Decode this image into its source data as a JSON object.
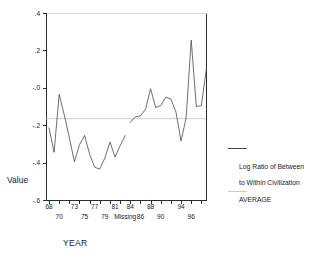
{
  "chart_data": {
    "type": "line",
    "title": "",
    "xlabel": "YEAR",
    "ylabel": "Value",
    "ylim": [
      -0.6,
      0.4
    ],
    "yticks": [
      0.4,
      0.2,
      -0.0,
      -0.2,
      -0.4,
      -0.6
    ],
    "ytick_labels": [
      ".4",
      ".2",
      "-.0",
      "-.2",
      "-.4",
      "-.6"
    ],
    "xtick_labels_row_a": [
      "68",
      "73",
      "77",
      "81",
      "84",
      "88",
      "94"
    ],
    "xtick_labels_row_b": [
      "70",
      "75",
      "79",
      "Missing",
      "86",
      "90",
      "96"
    ],
    "x_categories": [
      "68",
      "69",
      "70",
      "71",
      "72",
      "73",
      "74",
      "75",
      "76",
      "77",
      "78",
      "79",
      "80",
      "81",
      "82",
      "Missing",
      "83",
      "84",
      "85",
      "86",
      "87",
      "88",
      "89",
      "90",
      "91",
      "92",
      "93",
      "94",
      "95",
      "96",
      "97"
    ],
    "grid": false,
    "legend_position": "right",
    "series": [
      {
        "name": "Log Ratio of Between to Within Civilization",
        "color": "#4a4a4a",
        "style": "solid",
        "segments": [
          {
            "x": [
              "68",
              "69",
              "70",
              "71",
              "72",
              "73",
              "74",
              "75",
              "76",
              "77",
              "78",
              "79",
              "80",
              "81",
              "82"
            ],
            "values": [
              -0.215,
              -0.345,
              -0.035,
              -0.145,
              -0.265,
              -0.395,
              -0.305,
              -0.255,
              -0.355,
              -0.425,
              -0.435,
              -0.375,
              -0.29,
              -0.37,
              -0.31,
              -0.255
            ]
          },
          {
            "x": [
              "83",
              "84",
              "85",
              "86",
              "87",
              "88",
              "89",
              "90",
              "91",
              "92",
              "93",
              "94",
              "95",
              "96",
              "97"
            ],
            "values": [
              -0.185,
              -0.155,
              -0.15,
              -0.115,
              -0.005,
              -0.105,
              -0.095,
              -0.05,
              -0.06,
              -0.13,
              -0.285,
              -0.16,
              0.255,
              -0.1,
              -0.095,
              0.105
            ]
          }
        ]
      },
      {
        "name": "AVERAGE",
        "color": "#c2c2c2",
        "style": "reference-line",
        "value": -0.165
      }
    ]
  },
  "axis_titles": {
    "y": "Value",
    "x": "YEAR"
  },
  "legend": {
    "series_line1": "Log Ratio of Between",
    "series_line2": "to Within Civilization",
    "average_label": "AVERAGE"
  }
}
